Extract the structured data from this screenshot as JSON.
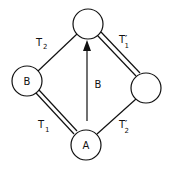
{
  "diagram": {
    "nodes": [
      {
        "id": "top",
        "label": ""
      },
      {
        "id": "left",
        "label": "B"
      },
      {
        "id": "right",
        "label": ""
      },
      {
        "id": "bottom",
        "label": "A"
      }
    ],
    "edges": [
      {
        "from": "left",
        "to": "top",
        "label_main": "T",
        "label_prime": "",
        "label_sub": "2",
        "style": "single"
      },
      {
        "from": "top",
        "to": "right",
        "label_main": "T",
        "label_prime": "′",
        "label_sub": "1",
        "style": "double"
      },
      {
        "from": "bottom",
        "to": "left",
        "label_main": "T",
        "label_prime": "",
        "label_sub": "1",
        "style": "double"
      },
      {
        "from": "bottom",
        "to": "right",
        "label_main": "T",
        "label_prime": "′",
        "label_sub": "2",
        "style": "single"
      }
    ],
    "arrow": {
      "from": "bottom",
      "to": "top",
      "label": "B"
    }
  }
}
